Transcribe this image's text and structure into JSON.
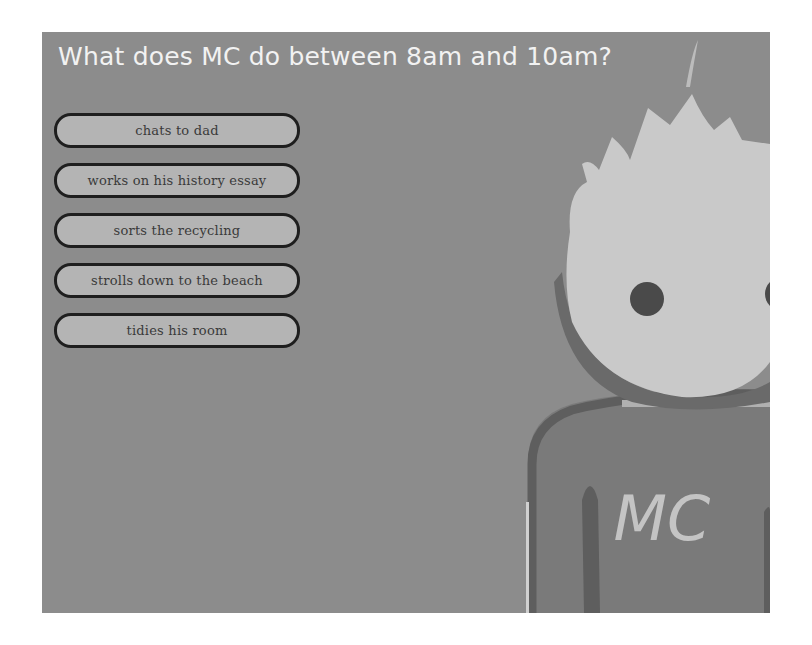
{
  "question": {
    "title": "What does MC do between 8am and 10am?"
  },
  "options": [
    {
      "label": "chats to dad"
    },
    {
      "label": "works on his history essay"
    },
    {
      "label": "sorts the recycling"
    },
    {
      "label": "strolls down to the beach"
    },
    {
      "label": "tidies his room"
    }
  ],
  "character": {
    "shirt_text": "MC",
    "colors": {
      "background": "#8c8c8c",
      "face": "#c9c9c9",
      "eyes": "#4a4a4a",
      "shirt": "#7a7a7a",
      "shirt_outline": "#5e5e5e",
      "shirt_letters": "#c4c4c4"
    }
  },
  "colors": {
    "title_text": "#f2f2f2",
    "button_fill": "#b4b4b4",
    "button_border": "#1e1e1e",
    "button_text": "#3a3a3a"
  }
}
